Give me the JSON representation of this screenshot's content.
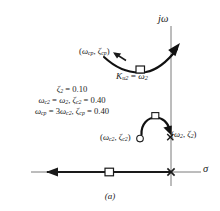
{
  "figure": {
    "caption": "(a)",
    "axes": {
      "vertical_label": "jω",
      "horizontal_label": "σ"
    },
    "annotations": {
      "compensator_zero_pair": {
        "omega": "ω",
        "omega_sub": "cp",
        "zeta": "ζ",
        "zeta_sub": "cp",
        "text": "(ω cp, ζ cp)"
      },
      "gain_label": {
        "k": "K",
        "k_sub": "u2",
        "equals": "=",
        "omega": "ω",
        "omega_sub": "2",
        "text": "Ku2 = ω2"
      },
      "closed_loop_pair": {
        "omega": "ω",
        "omega_sub": "c2",
        "zeta": "ζ",
        "zeta_sub": "c2",
        "text": "(ω c2, ζ c2)"
      },
      "plant_pole_pair": {
        "omega": "ω",
        "omega_sub": "2",
        "zeta": "ζ",
        "zeta_sub": "2",
        "text": "(ω 2, ζ 2)"
      }
    },
    "parameters": [
      {
        "id": "zeta2",
        "parts": [
          {
            "sym": "ζ",
            "sub": "2"
          },
          {
            "op": " = "
          },
          {
            "num": "0.10"
          }
        ]
      },
      {
        "id": "omega-c2",
        "parts": [
          {
            "sym": "ω",
            "sub": "c2"
          },
          {
            "op": " = "
          },
          {
            "sym": "ω",
            "sub": "2"
          },
          {
            "op": ", "
          },
          {
            "sym": "ζ",
            "sub": "c2"
          },
          {
            "op": " = "
          },
          {
            "num": "0.40"
          }
        ]
      },
      {
        "id": "omega-cp",
        "parts": [
          {
            "sym": "ω",
            "sub": "cp"
          },
          {
            "op": " = "
          },
          {
            "num": "3"
          },
          {
            "sym": "ω",
            "sub": "c2"
          },
          {
            "op": ", "
          },
          {
            "sym": "ζ",
            "sub": "cp"
          },
          {
            "op": " = "
          },
          {
            "num": "0.40"
          }
        ]
      }
    ],
    "colors": {
      "ink": "#1a1a1a",
      "axis": "#6b6b6b",
      "locus": "#111111",
      "marker_fill": "#ffffff"
    }
  },
  "chart_data": {
    "type": "scatter",
    "title": "",
    "subtitle": "",
    "xlabel": "σ",
    "ylabel": "jω",
    "grid": false,
    "legend": "none",
    "plane": "s-plane root locus sketch",
    "axis_origin": {
      "x": 171,
      "y": 172
    },
    "xlim": [
      -1.0,
      0.12
    ],
    "ylim": [
      -0.08,
      1.0
    ],
    "series": [
      {
        "name": "upper complex root locus branch",
        "type": "line",
        "arrow_end": "upper-right",
        "points": [
          {
            "x": -0.34,
            "y": 0.72
          },
          {
            "x": -0.26,
            "y": 0.64
          },
          {
            "x": -0.17,
            "y": 0.59
          },
          {
            "x": -0.09,
            "y": 0.58
          },
          {
            "x": -0.02,
            "y": 0.61
          },
          {
            "x": 0.05,
            "y": 0.68
          },
          {
            "x": 0.11,
            "y": 0.78
          }
        ]
      },
      {
        "name": "real-axis locus branch",
        "type": "line",
        "arrow_end": "left",
        "points": [
          {
            "x": -0.93,
            "y": 0.0
          },
          {
            "x": 0.0,
            "y": 0.0
          }
        ]
      },
      {
        "name": "departure arc near plant pole",
        "type": "arc",
        "arrow_end": "right",
        "points": [
          {
            "x": -0.22,
            "y": 0.18
          },
          {
            "x": -0.17,
            "y": 0.27
          },
          {
            "x": -0.09,
            "y": 0.3
          },
          {
            "x": -0.02,
            "y": 0.25
          },
          {
            "x": 0.0,
            "y": 0.18
          }
        ]
      }
    ],
    "markers": [
      {
        "name": "open-loop-zero-on-locus",
        "shape": "square",
        "x": -0.12,
        "y": 0.585
      },
      {
        "name": "open-loop-zero-real-axis",
        "shape": "square",
        "x": -0.4,
        "y": 0.0
      },
      {
        "name": "compensated-closed-loop-pole",
        "shape": "square",
        "x": -0.1,
        "y": 0.295
      },
      {
        "name": "closed-loop-pole-circle",
        "shape": "circle",
        "x": -0.21,
        "y": 0.175
      },
      {
        "name": "plant-pole-cross",
        "shape": "cross",
        "x": -0.01,
        "y": 0.19
      },
      {
        "name": "origin-pole-cross",
        "shape": "cross",
        "x": 0.0,
        "y": 0.0
      }
    ],
    "annotations": [
      {
        "text": "(ωcp, ζcp)",
        "x": -0.62,
        "y": 0.78
      },
      {
        "text": "Ku2 = ω2",
        "x": -0.36,
        "y": 0.47
      },
      {
        "text": "(ωc2, ζc2)",
        "x": -0.48,
        "y": 0.15
      },
      {
        "text": "(ω2, ζ2)",
        "x": 0.04,
        "y": 0.18
      },
      {
        "text": "ζ2 = 0.10",
        "x": -0.7,
        "y": 0.4
      },
      {
        "text": "ωc2 = ω2, ζc2 = 0.40",
        "x": -0.7,
        "y": 0.33
      },
      {
        "text": "ωcp = 3ωc2, ζcp = 0.40",
        "x": -0.7,
        "y": 0.26
      }
    ]
  }
}
